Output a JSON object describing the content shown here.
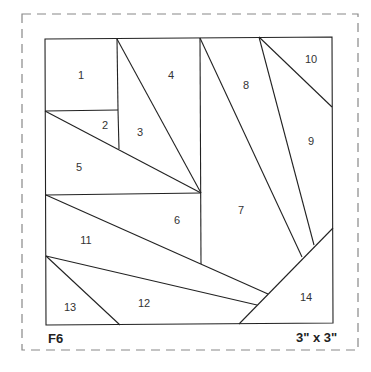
{
  "pattern": {
    "id": "F6",
    "size": "3\" x 3\"",
    "pieces": [
      "1",
      "2",
      "3",
      "4",
      "5",
      "6",
      "7",
      "8",
      "9",
      "10",
      "11",
      "12",
      "13",
      "14"
    ]
  }
}
